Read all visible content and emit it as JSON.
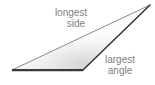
{
  "diagram": {
    "background_color": "#ffffff",
    "width": 155,
    "height": 85,
    "labels": {
      "longest_side": {
        "line1": "longest",
        "line2": "side",
        "full_text": "longest side",
        "color": "#808080"
      },
      "largest_angle": {
        "line1": "largest",
        "line2": "angle",
        "full_text": "largest angle",
        "color": "#808080"
      }
    },
    "shape": {
      "type": "triangle",
      "vertices": [
        {
          "name": "left-vertex",
          "x": 12,
          "y": 70
        },
        {
          "name": "bottom-right-vertex",
          "x": 83,
          "y": 70
        },
        {
          "name": "apex-vertex",
          "x": 150,
          "y": 5
        }
      ],
      "edges": [
        {
          "name": "bottom-edge",
          "from": "left-vertex",
          "to": "bottom-right-vertex",
          "color": "#3a3a3a",
          "width": 2.0
        },
        {
          "name": "longest-side-edge",
          "from": "left-vertex",
          "to": "apex-vertex",
          "color": "#8a8a8a",
          "width": 1.0
        },
        {
          "name": "largest-angle-edge",
          "from": "bottom-right-vertex",
          "to": "apex-vertex",
          "color": "#2e2e2e",
          "width": 1.4
        }
      ],
      "fill": {
        "type": "gradient",
        "from_color": "#ffffff",
        "to_color": "#e0e0e0"
      }
    }
  }
}
